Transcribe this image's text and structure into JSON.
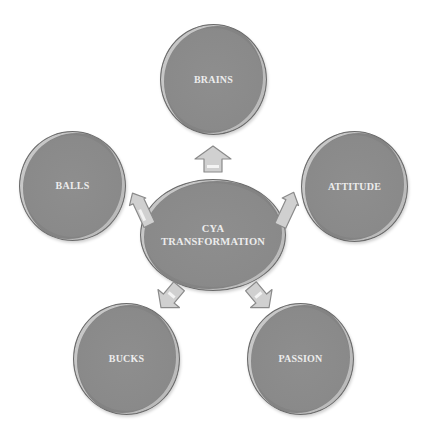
{
  "diagram": {
    "center": {
      "line1": "CYA",
      "line2": "TRANSFORMATION"
    },
    "nodes": [
      {
        "id": "brains",
        "label": "BRAINS",
        "position": "top"
      },
      {
        "id": "balls",
        "label": "BALLS",
        "position": "left"
      },
      {
        "id": "attitude",
        "label": "ATTITUDE",
        "position": "right"
      },
      {
        "id": "bucks",
        "label": "BUCKS",
        "position": "bottom-left"
      },
      {
        "id": "passion",
        "label": "PASSION",
        "position": "bottom-right"
      }
    ],
    "arrows": [
      {
        "from": "center",
        "to": "brains",
        "icon": "arrow-up-icon"
      },
      {
        "from": "center",
        "to": "balls",
        "icon": "arrow-upleft-icon"
      },
      {
        "from": "center",
        "to": "attitude",
        "icon": "arrow-upright-icon"
      },
      {
        "from": "center",
        "to": "bucks",
        "icon": "arrow-downleft-icon"
      },
      {
        "from": "center",
        "to": "passion",
        "icon": "arrow-downright-icon"
      }
    ],
    "colors": {
      "node_fill": "#8a8a8a",
      "node_border": "#6a6a6a",
      "label_text": "#ececec",
      "arrow_fill": "#cfcfcf",
      "arrow_stroke": "#8a8a8a",
      "background": "#ffffff"
    }
  }
}
